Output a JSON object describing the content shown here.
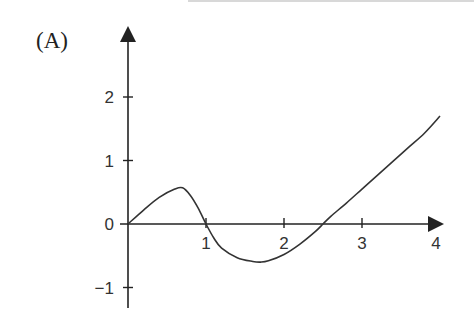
{
  "panel": {
    "label": "(A)"
  },
  "chart_data": {
    "type": "line",
    "title": "",
    "xlabel": "",
    "ylabel": "",
    "xlim": [
      0,
      4
    ],
    "ylim": [
      -1.3,
      2.8
    ],
    "grid": false,
    "legend": null,
    "x_ticks": [
      "1",
      "2",
      "3",
      "4"
    ],
    "y_ticks": [
      "2",
      "1",
      "0",
      "−1"
    ],
    "series": [
      {
        "name": "f(x)",
        "x": [
          0,
          0.2,
          0.4,
          0.6,
          0.7,
          0.8,
          0.9,
          1.0,
          1.1,
          1.2,
          1.4,
          1.6,
          1.7,
          1.8,
          2.0,
          2.2,
          2.4,
          2.5,
          2.6,
          2.8,
          3.0,
          3.2,
          3.4,
          3.6,
          3.8,
          4.0
        ],
        "values": [
          0,
          0.22,
          0.42,
          0.55,
          0.57,
          0.45,
          0.25,
          0.0,
          -0.22,
          -0.38,
          -0.53,
          -0.59,
          -0.6,
          -0.58,
          -0.48,
          -0.32,
          -0.12,
          0.0,
          0.12,
          0.33,
          0.55,
          0.77,
          0.99,
          1.21,
          1.43,
          1.7
        ]
      }
    ]
  }
}
